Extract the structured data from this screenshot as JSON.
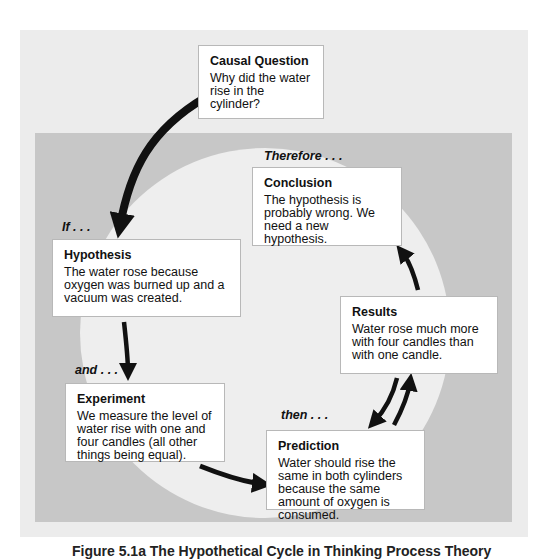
{
  "diagram": {
    "type": "cycle",
    "boxes": {
      "causal_question": {
        "title": "Causal Question",
        "text": "Why did the water rise in the cylinder?"
      },
      "conclusion": {
        "title": "Conclusion",
        "text": "The hypothesis is probably wrong. We need a new hypothesis."
      },
      "hypothesis": {
        "title": "Hypothesis",
        "text": "The water rose because oxygen was burned up and a vacuum was created."
      },
      "results": {
        "title": "Results",
        "text": "Water rose much more with four candles than with one candle."
      },
      "experiment": {
        "title": "Experiment",
        "text": "We measure the level of water rise with one and four candles (all other things being equal)."
      },
      "prediction": {
        "title": "Prediction",
        "text": "Water should rise the same in both cylinders because the same amount of oxygen is consumed."
      }
    },
    "connectors": {
      "if": "If . . .",
      "and": "and . . .",
      "then": "then . . .",
      "therefore": "Therefore . . ."
    },
    "flow": [
      "Causal Question",
      "Hypothesis",
      "Experiment",
      "Prediction",
      "Results",
      "Conclusion"
    ],
    "colors": {
      "outer_panel": "#ececec",
      "inner_panel": "#c7c7c7",
      "circle": "#eeeeee",
      "arrow": "#111111",
      "box": "#ffffff"
    }
  },
  "caption": "Figure 5.1a   The Hypothetical Cycle in Thinking Process Theory"
}
